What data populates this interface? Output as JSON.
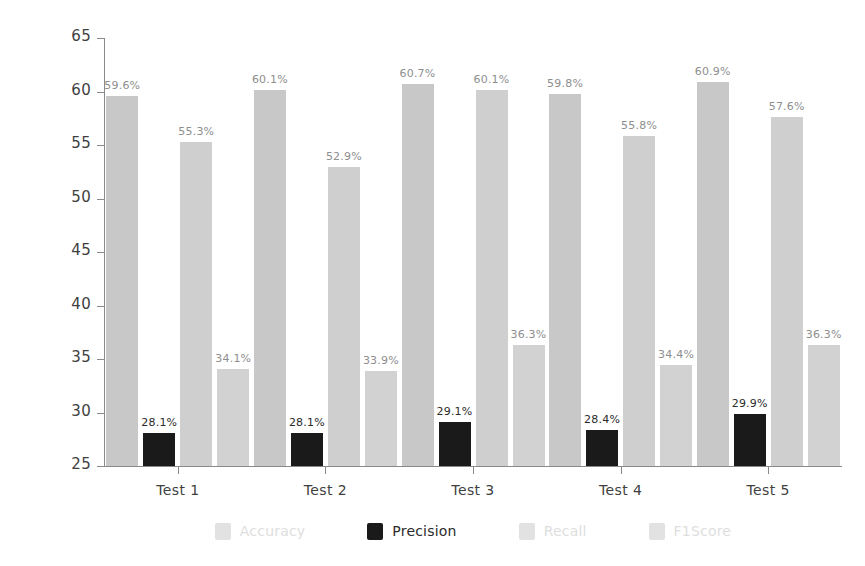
{
  "chart_data": {
    "type": "bar",
    "title": "",
    "xlabel": "",
    "ylabel": "Percentage [%]",
    "ylim": [
      25,
      65
    ],
    "yticks": [
      25,
      30,
      35,
      40,
      45,
      50,
      55,
      60,
      65
    ],
    "grid": false,
    "legend_position": "bottom",
    "value_label_suffix": "%",
    "categories": [
      "Test 1",
      "Test 2",
      "Test 3",
      "Test 4",
      "Test 5"
    ],
    "series": [
      {
        "name": "Accuracy",
        "color": "#c8c8c8",
        "values": [
          59.6,
          60.1,
          60.7,
          59.8,
          60.9
        ],
        "labels": [
          "59.6%",
          "60.1%",
          "60.7%",
          "59.8%",
          "60.9%"
        ]
      },
      {
        "name": "Precision",
        "color": "#1a1a1a",
        "values": [
          28.1,
          28.1,
          29.1,
          28.4,
          29.9
        ],
        "labels": [
          "28.1%",
          "28.1%",
          "29.1%",
          "28.4%",
          "29.9%"
        ]
      },
      {
        "name": "Recall",
        "color": "#cfcfcf",
        "values": [
          55.3,
          52.9,
          60.1,
          55.8,
          57.6
        ],
        "labels": [
          "55.3%",
          "52.9%",
          "60.1%",
          "55.8%",
          "57.6%"
        ]
      },
      {
        "name": "F1Score",
        "color": "#d2d2d2",
        "values": [
          34.1,
          33.9,
          36.3,
          34.4,
          36.3
        ],
        "labels": [
          "34.1%",
          "33.9%",
          "36.3%",
          "34.4%",
          "36.3%"
        ]
      }
    ]
  },
  "legend": {
    "items": [
      {
        "label": "Accuracy",
        "color": "#d6d6d6"
      },
      {
        "label": "Precision",
        "color": "#1a1a1a"
      },
      {
        "label": "Recall",
        "color": "#dcdcdc"
      },
      {
        "label": "F1Score",
        "color": "#dcdcdc"
      }
    ]
  },
  "colors": {
    "accuracy": "#c8c8c8",
    "precision": "#1a1a1a",
    "recall": "#cfcfcf",
    "f1score": "#d2d2d2",
    "axis": "#8a8a8a",
    "text": "#3f3f3f",
    "background": "#ffffff"
  }
}
